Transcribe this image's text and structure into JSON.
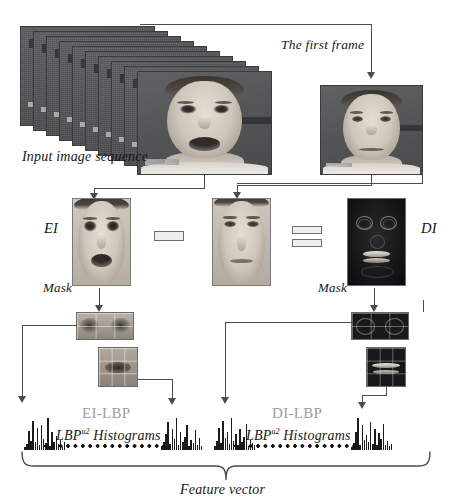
{
  "figure": {
    "background_color": "#ffffff",
    "line_color": "#4c4c4c",
    "text_color": "#171717",
    "muted_text_color": "#9d9d9d"
  },
  "labels": {
    "input_sequence": "Input image sequence",
    "first_frame": "The first frame",
    "ei": "EI",
    "di": "DI",
    "mask_left": "Mask",
    "mask_right": "Mask",
    "ei_lbp": "EI-LBP",
    "di_lbp": "DI-LBP",
    "hist_left_base": "LBP",
    "hist_left_sup": "u2",
    "hist_left_tail": " Histograms",
    "hist_right_base": "LBP",
    "hist_right_sup": "u2",
    "hist_right_tail": " Histograms",
    "feature_vector": "Feature vector",
    "minus_symbol": "minus",
    "equals_symbol": "equals"
  },
  "sequence": {
    "frame_count": 10,
    "description": "stack of grayscale video frames of a face"
  },
  "chart_data": {
    "type": "bar",
    "series": [
      {
        "name": "EI-LBP first block",
        "values": [
          3,
          7,
          22,
          11,
          34,
          9,
          26,
          6,
          30,
          13,
          8,
          38,
          5,
          21,
          10,
          17,
          7,
          12,
          4,
          9
        ]
      },
      {
        "name": "EI-LBP last block",
        "values": [
          4,
          9,
          18,
          31,
          7,
          24,
          12,
          36,
          6,
          20,
          9,
          15,
          28,
          5,
          11,
          8,
          22,
          6,
          13,
          5
        ]
      },
      {
        "name": "DI-LBP first block",
        "values": [
          5,
          11,
          26,
          8,
          33,
          14,
          21,
          7,
          37,
          10,
          18,
          6,
          24,
          9,
          15,
          30,
          5,
          12,
          8,
          6
        ]
      },
      {
        "name": "DI-LBP last block",
        "values": [
          3,
          8,
          20,
          35,
          6,
          27,
          11,
          16,
          9,
          31,
          7,
          23,
          5,
          19,
          12,
          28,
          6,
          10,
          4,
          7
        ]
      }
    ],
    "xlabel": "LBP uniform pattern bin",
    "ylabel": "frequency",
    "grid": false,
    "legend": "none"
  }
}
